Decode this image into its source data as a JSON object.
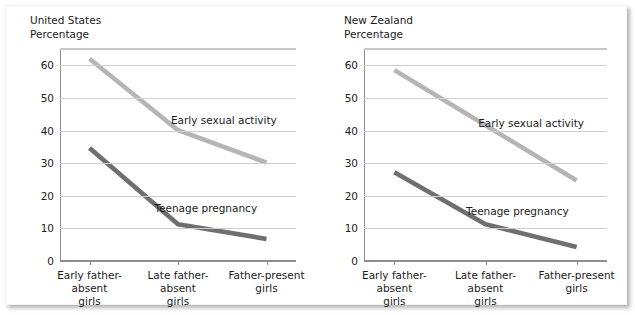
{
  "figure": {
    "panels": [
      {
        "key": "united_states",
        "title_line1": "United States",
        "title_line2": "Percentage"
      },
      {
        "key": "new_zealand",
        "title_line1": "New Zealand",
        "title_line2": "Percentage"
      }
    ]
  },
  "chart_data": [
    {
      "type": "line",
      "title": "United States",
      "subtitle": "Percentage",
      "xlabel": "",
      "ylabel": "Percentage",
      "ylim": [
        0,
        65
      ],
      "yticks": [
        0,
        10,
        20,
        30,
        40,
        50,
        60
      ],
      "ytick_labels": [
        "0",
        "10",
        "20",
        "30",
        "40",
        "50",
        "60"
      ],
      "grid": true,
      "legend_position": "inline-annotation",
      "categories": [
        "Early father-absent girls",
        "Late father-absent girls",
        "Father-present girls"
      ],
      "series": [
        {
          "name": "Early sexual activity",
          "color": "#b5b5b5",
          "values": [
            62,
            40,
            30
          ]
        },
        {
          "name": "Teenage pregnancy",
          "color": "#6f6f6f",
          "values": [
            34.5,
            11,
            6.5
          ]
        }
      ],
      "annotations": [
        {
          "text": "Early sexual activity",
          "x_frac": 0.47,
          "y_value": 43
        },
        {
          "text": "Teenage pregnancy",
          "x_frac": 0.4,
          "y_value": 16
        }
      ]
    },
    {
      "type": "line",
      "title": "New Zealand",
      "subtitle": "Percentage",
      "xlabel": "",
      "ylabel": "Percentage",
      "ylim": [
        0,
        65
      ],
      "yticks": [
        0,
        10,
        20,
        30,
        40,
        50,
        60
      ],
      "ytick_labels": [
        "0",
        "10",
        "20",
        "30",
        "40",
        "50",
        "60"
      ],
      "grid": true,
      "legend_position": "inline-annotation",
      "categories": [
        "Early father-absent girls",
        "Late father-absent girls",
        "Father-present girls"
      ],
      "series": [
        {
          "name": "Early sexual activity",
          "color": "#b5b5b5",
          "values": [
            58.5,
            41.5,
            24.5
          ]
        },
        {
          "name": "Teenage pregnancy",
          "color": "#6f6f6f",
          "values": [
            27,
            11,
            4
          ]
        }
      ],
      "annotations": [
        {
          "text": "Early sexual activity",
          "x_frac": 0.47,
          "y_value": 42
        },
        {
          "text": "Teenage pregnancy",
          "x_frac": 0.42,
          "y_value": 15
        }
      ]
    }
  ]
}
